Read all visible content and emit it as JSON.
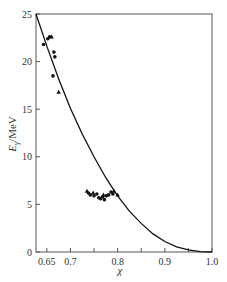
{
  "chart_data": {
    "type": "scatter",
    "title": "",
    "xlabel": "χ",
    "ylabel": "Eγ/MeV",
    "ylabel_parts": {
      "main": "E",
      "sub": "γ",
      "unit": "/MeV"
    },
    "xlim": [
      0.627,
      1.0
    ],
    "ylim": [
      0,
      25
    ],
    "x_ticks": [
      0.65,
      0.7,
      0.75,
      0.8,
      0.85,
      0.9,
      0.95,
      1.0
    ],
    "x_tick_labels": [
      "0.65",
      "0.7",
      "",
      "0.8",
      "",
      "0.9",
      "",
      "1.0"
    ],
    "y_ticks": [
      0,
      5,
      10,
      15,
      20,
      25
    ],
    "y_tick_labels": [
      "0",
      "5",
      "10",
      "15",
      "20",
      "25"
    ],
    "grid": false,
    "legend": null,
    "series": [
      {
        "name": "circles",
        "marker": "circle",
        "points": [
          [
            0.643,
            21.8
          ],
          [
            0.652,
            22.4
          ],
          [
            0.656,
            22.6
          ],
          [
            0.665,
            21.0
          ],
          [
            0.667,
            20.5
          ],
          [
            0.663,
            18.5
          ],
          [
            0.738,
            6.2
          ],
          [
            0.742,
            6.0
          ],
          [
            0.75,
            5.9
          ],
          [
            0.756,
            6.1
          ],
          [
            0.76,
            5.7
          ],
          [
            0.764,
            5.6
          ],
          [
            0.768,
            5.8
          ],
          [
            0.772,
            5.5
          ],
          [
            0.776,
            5.9
          ],
          [
            0.781,
            6.0
          ],
          [
            0.786,
            6.3
          ],
          [
            0.79,
            6.1
          ]
        ]
      },
      {
        "name": "triangles",
        "marker": "triangle",
        "points": [
          [
            0.66,
            22.6
          ],
          [
            0.675,
            16.8
          ],
          [
            0.735,
            6.4
          ],
          [
            0.748,
            6.2
          ],
          [
            0.77,
            6.0
          ],
          [
            0.792,
            6.4
          ],
          [
            0.8,
            6.0
          ]
        ]
      },
      {
        "name": "theory-curve",
        "marker": "line",
        "points": [
          [
            0.627,
            25.0
          ],
          [
            0.65,
            21.6
          ],
          [
            0.675,
            18.2
          ],
          [
            0.7,
            15.1
          ],
          [
            0.725,
            12.4
          ],
          [
            0.75,
            10.0
          ],
          [
            0.775,
            7.8
          ],
          [
            0.8,
            5.9
          ],
          [
            0.825,
            4.3
          ],
          [
            0.85,
            3.0
          ],
          [
            0.875,
            1.9
          ],
          [
            0.9,
            1.1
          ],
          [
            0.925,
            0.55
          ],
          [
            0.95,
            0.22
          ],
          [
            0.975,
            0.04
          ],
          [
            1.0,
            0.0
          ]
        ]
      }
    ]
  }
}
